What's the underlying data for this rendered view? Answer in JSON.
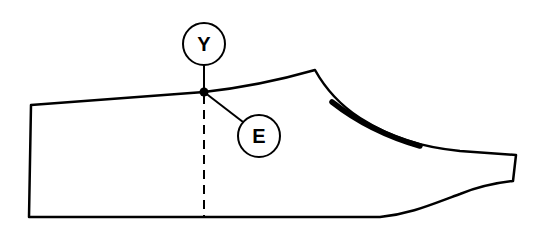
{
  "diagram": {
    "labels": [
      {
        "id": "Y",
        "text": "Y",
        "cx": 204,
        "cy": 44,
        "r": 21
      },
      {
        "id": "E",
        "text": "E",
        "cx": 259,
        "cy": 136,
        "r": 21
      }
    ],
    "marker_point": {
      "x": 204,
      "y": 92
    },
    "colors": {
      "stroke": "#000000",
      "background": "#ffffff"
    }
  }
}
